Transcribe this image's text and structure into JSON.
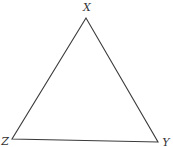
{
  "diagram": {
    "type": "triangle",
    "stroke_color": "#3a3a3a",
    "vertices": [
      {
        "label": "X",
        "x": 86,
        "y": 18,
        "label_x": 87,
        "label_y": 11
      },
      {
        "label": "Z",
        "x": 12,
        "y": 139,
        "label_x": 5,
        "label_y": 145
      },
      {
        "label": "Y",
        "x": 158,
        "y": 142,
        "label_x": 166,
        "label_y": 146
      }
    ]
  }
}
